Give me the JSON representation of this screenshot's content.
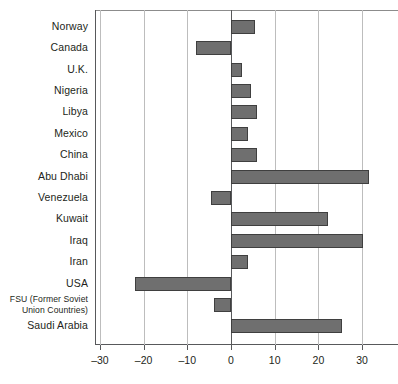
{
  "chart_data": {
    "type": "bar",
    "orientation": "horizontal",
    "title": "",
    "subtitle": "",
    "xlabel": "",
    "ylabel": "",
    "xlim": [
      -35,
      35
    ],
    "xticks": [
      -30,
      -20,
      -10,
      0,
      10,
      20,
      30
    ],
    "xtick_labels": [
      "–30",
      "–20",
      "–10",
      "0",
      "10",
      "20",
      "30"
    ],
    "grid": true,
    "legend": null,
    "bar_color": "#6f6f6f",
    "bar_border_color": "#3f3f3f",
    "axis_color": "#58595b",
    "gridline_color": "#bdbdbd",
    "categories": [
      "Norway",
      "Canada",
      "U.K.",
      "Nigeria",
      "Libya",
      "Mexico",
      "China",
      "Abu Dhabi",
      "Venezuela",
      "Kuwait",
      "Iraq",
      "Iran",
      "USA",
      "FSU (Former Soviet Union Countries)",
      "Saudi Arabia"
    ],
    "values": [
      5.5,
      -8,
      2.5,
      4.5,
      6,
      3.8,
      6,
      31.5,
      -4.6,
      22.3,
      30.3,
      4,
      -22,
      -4,
      25.5
    ]
  },
  "categories_display": [
    {
      "line1": "Norway",
      "line2": "",
      "two_line": false
    },
    {
      "line1": "Canada",
      "line2": "",
      "two_line": false
    },
    {
      "line1": "U.K.",
      "line2": "",
      "two_line": false
    },
    {
      "line1": "Nigeria",
      "line2": "",
      "two_line": false
    },
    {
      "line1": "Libya",
      "line2": "",
      "two_line": false
    },
    {
      "line1": "Mexico",
      "line2": "",
      "two_line": false
    },
    {
      "line1": "China",
      "line2": "",
      "two_line": false
    },
    {
      "line1": "Abu Dhabi",
      "line2": "",
      "two_line": false
    },
    {
      "line1": "Venezuela",
      "line2": "",
      "two_line": false
    },
    {
      "line1": "Kuwait",
      "line2": "",
      "two_line": false
    },
    {
      "line1": "Iraq",
      "line2": "",
      "two_line": false
    },
    {
      "line1": "Iran",
      "line2": "",
      "two_line": false
    },
    {
      "line1": "USA",
      "line2": "",
      "two_line": false
    },
    {
      "line1": "FSU (Former Soviet",
      "line2": "Union Countries)",
      "two_line": true
    },
    {
      "line1": "Saudi Arabia",
      "line2": "",
      "two_line": false
    }
  ]
}
